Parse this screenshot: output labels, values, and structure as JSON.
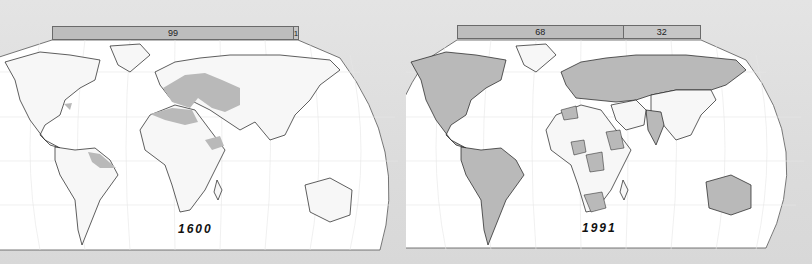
{
  "figure": {
    "panels": [
      {
        "year_label": "1600",
        "share_bar": {
          "segments": [
            {
              "label": "99",
              "value": 99,
              "color": "#bdbdbd"
            },
            {
              "label": "1",
              "value": 1,
              "color": "#c6c6c6"
            }
          ]
        },
        "shaded_regions": [
          "Europe",
          "Ottoman / Middle East",
          "North Africa",
          "Horn of Africa",
          "Northeast South America coast",
          "US East coast"
        ]
      },
      {
        "year_label": "1991",
        "share_bar": {
          "segments": [
            {
              "label": "68",
              "value": 68,
              "color": "#bdbdbd"
            },
            {
              "label": "32",
              "value": 32,
              "color": "#c6c6c6"
            }
          ]
        },
        "shaded_regions": [
          "North America",
          "Latin America",
          "Europe",
          "USSR",
          "India",
          "Australia",
          "Southern Africa",
          "selected African and Asian states"
        ]
      }
    ],
    "colors": {
      "shaded_land": "#b9b9b9",
      "unshaded_land": "#f7f7f7",
      "ocean": "#ffffff",
      "coastline": "#1a1a1a",
      "background": "#dedede"
    }
  }
}
